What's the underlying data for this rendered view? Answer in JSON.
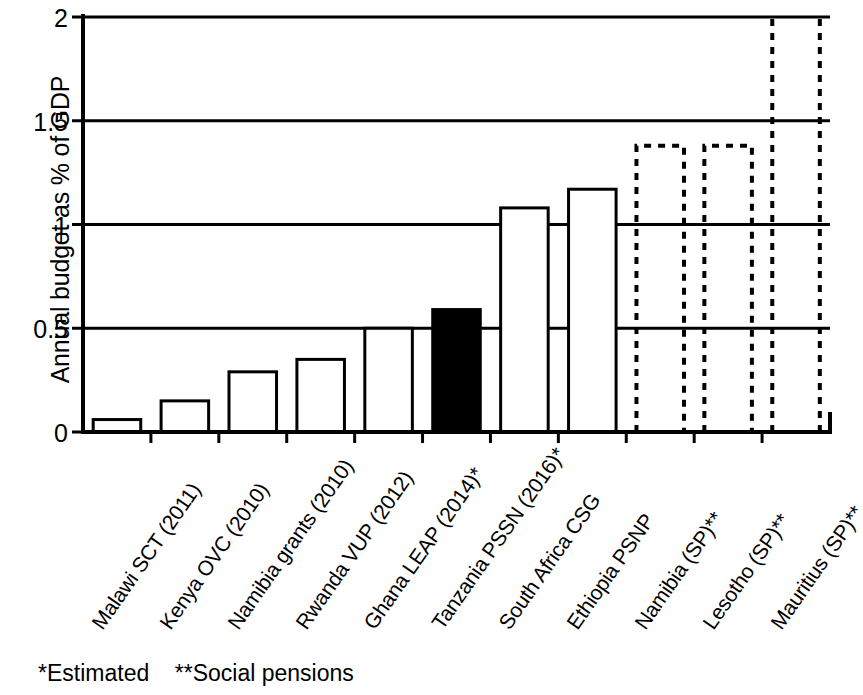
{
  "chart_data": {
    "type": "bar",
    "title": "",
    "xlabel": "",
    "ylabel": "Annual budget as % of GDP",
    "ylim": [
      0,
      2
    ],
    "yticks": [
      "0",
      "0.5",
      "1",
      "1.5",
      "2"
    ],
    "ytick_values": [
      0,
      0.5,
      1,
      1.5,
      2
    ],
    "grid": "horizontal",
    "legend": "none",
    "categories": [
      "Malawi SCT (2011)",
      "Kenya OVC (2010)",
      "Namibia grants (2010)",
      "Rwanda VUP (2012)",
      "Ghana LEAP (2014)*",
      "Tanzania PSSN (2016)*",
      "South Africa CSG",
      "Ethiopia PSNP",
      "Namibia (SP)**",
      "Lesotho (SP)**",
      "Mauritius (SP)**"
    ],
    "values": [
      0.06,
      0.15,
      0.29,
      0.35,
      0.5,
      0.59,
      1.08,
      1.17,
      1.38,
      1.38,
      2.0
    ],
    "bar_styles": [
      "open",
      "open",
      "open",
      "open",
      "open",
      "filled",
      "open",
      "open",
      "dashed",
      "dashed",
      "dashed-clipped"
    ],
    "notes": [
      "Mauritius (SP)** bar exceeds the plotted axis maximum of 2 and is clipped at the top of the chart."
    ],
    "annotations": [
      "*Estimated",
      "**Social pensions"
    ]
  },
  "footnote": {
    "text": "*Estimated    **Social pensions",
    "estimated": "*Estimated",
    "social_pensions": "**Social pensions"
  },
  "colors": {
    "axis": "#000000",
    "grid": "#000000",
    "bar_open_stroke": "#000000",
    "bar_open_fill": "#ffffff",
    "bar_filled": "#000000",
    "bar_dashed_stroke": "#000000",
    "background": "#ffffff"
  }
}
